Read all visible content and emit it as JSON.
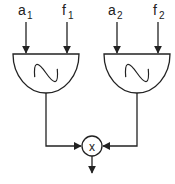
{
  "diagram": {
    "type": "signal-flow",
    "oscillators": [
      {
        "id": "osc1",
        "icon": "sine-wave-icon",
        "inputs": [
          {
            "label": "a",
            "subscript": "1"
          },
          {
            "label": "f",
            "subscript": "1"
          }
        ]
      },
      {
        "id": "osc2",
        "icon": "sine-wave-icon",
        "inputs": [
          {
            "label": "a",
            "subscript": "2"
          },
          {
            "label": "f",
            "subscript": "2"
          }
        ]
      }
    ],
    "multiplier": {
      "symbol": "x"
    },
    "colors": {
      "stroke": "#222222",
      "background": "#ffffff"
    }
  }
}
